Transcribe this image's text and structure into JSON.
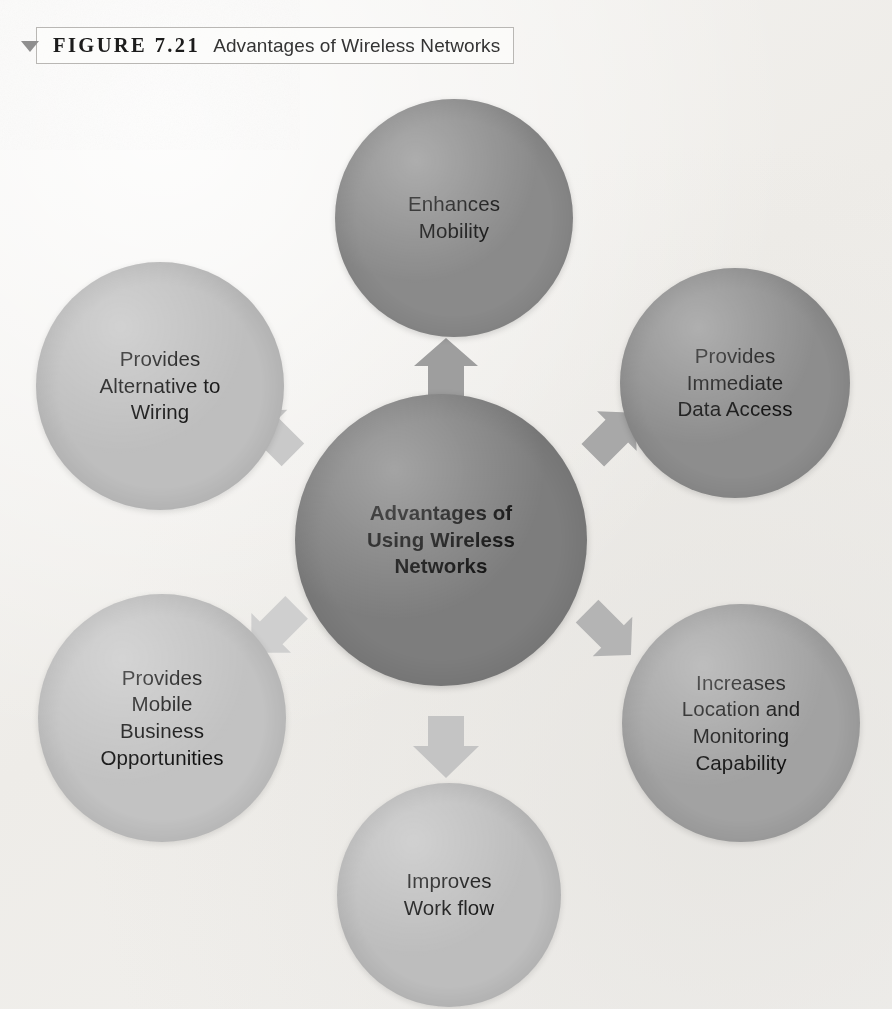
{
  "caption": {
    "marker_icon": "triangle-down-icon",
    "figure_label": "FIGURE 7.21",
    "figure_title": "Advantages of Wireless Networks"
  },
  "diagram": {
    "type": "radial-hub-and-spoke",
    "center": {
      "id": "center",
      "label": "Advantages of\nUsing Wireless\nNetworks",
      "line1": "Advantages of",
      "line2": "Using Wireless",
      "line3": "Networks",
      "fill": "#7d7d7d",
      "bold": true
    },
    "nodes": [
      {
        "id": "top",
        "position": "top",
        "label": "Enhances\nMobility",
        "line1": "Enhances",
        "line2": "Mobility",
        "fill": "#8a8a8a"
      },
      {
        "id": "upper-right",
        "position": "upper-right",
        "label": "Provides\nImmediate\nData Access",
        "line1": "Provides",
        "line2": "Immediate",
        "line3": "Data Access",
        "fill": "#8d8d8d"
      },
      {
        "id": "lower-right",
        "position": "lower-right",
        "label": "Increases\nLocation and\nMonitoring\nCapability",
        "line1": "Increases",
        "line2": "Location and",
        "line3": "Monitoring",
        "line4": "Capability",
        "fill": "#a2a2a2"
      },
      {
        "id": "bottom",
        "position": "bottom",
        "label": "Improves\nWork flow",
        "line1": "Improves",
        "line2": "Work flow",
        "fill": "#bdbdbd"
      },
      {
        "id": "lower-left",
        "position": "lower-left",
        "label": "Provides\nMobile\nBusiness\nOpportunities",
        "line1": "Provides",
        "line2": "Mobile",
        "line3": "Business",
        "line4": "Opportunities",
        "fill": "#c2c2c2"
      },
      {
        "id": "upper-left",
        "position": "upper-left",
        "label": "Provides\nAlternative to\nWiring",
        "line1": "Provides",
        "line2": "Alternative to",
        "line3": "Wiring",
        "fill": "#bebebe"
      }
    ],
    "arrows": [
      {
        "id": "arrow-up",
        "from": "center",
        "to": "top",
        "direction": "up",
        "fill": "#9e9e9e"
      },
      {
        "id": "arrow-up-right",
        "from": "center",
        "to": "upper-right",
        "direction": "up-right",
        "fill": "#a8a8a8"
      },
      {
        "id": "arrow-down-right",
        "from": "center",
        "to": "lower-right",
        "direction": "down-right",
        "fill": "#b4b4b4"
      },
      {
        "id": "arrow-down",
        "from": "center",
        "to": "bottom",
        "direction": "down",
        "fill": "#c4c4c4"
      },
      {
        "id": "arrow-down-left",
        "from": "center",
        "to": "lower-left",
        "direction": "down-left",
        "fill": "#cfcfcf"
      },
      {
        "id": "arrow-up-left",
        "from": "center",
        "to": "upper-left",
        "direction": "up-left",
        "fill": "#c9c9c9"
      }
    ]
  },
  "colors": {
    "page_background": "#f2f1ef",
    "text": "#111111",
    "caption_border": "#b9b7b4",
    "caption_marker": "#8f8f8f"
  }
}
